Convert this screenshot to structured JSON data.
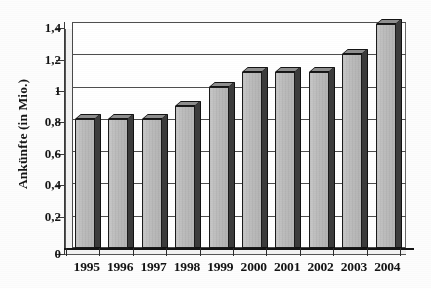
{
  "chart_data": {
    "type": "bar",
    "title": "",
    "xlabel": "",
    "ylabel": "Ankünfte (in Mio.)",
    "categories": [
      "1995",
      "1996",
      "1997",
      "1998",
      "1999",
      "2000",
      "2001",
      "2002",
      "2003",
      "2004"
    ],
    "values": [
      0.8,
      0.8,
      0.8,
      0.88,
      1.0,
      1.09,
      1.09,
      1.09,
      1.2,
      1.39
    ],
    "ylim": [
      0,
      1.4
    ],
    "ytick_values": [
      0,
      0.2,
      0.4,
      0.6,
      0.8,
      1.0,
      1.2,
      1.4
    ],
    "ytick_labels": [
      "0",
      "0,2",
      "0,4",
      "0,6",
      "0,8",
      "1",
      "1,2",
      "1,4"
    ],
    "grid": "horizontal",
    "legend": "none",
    "bar_style": "3d-shaded-gray",
    "colors": {
      "bar_face": "#bdbdbd",
      "bar_side": "#3b3b3b",
      "bar_top": "#8f8f8f",
      "bar_outline": "#1a1a1a",
      "gridline": "#4f4f4f",
      "axis": "#141414",
      "background": "#ffffff",
      "text": "#141414"
    }
  }
}
